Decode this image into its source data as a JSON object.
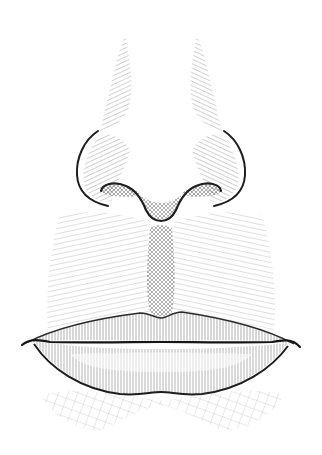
{
  "illustration": {
    "subject": "engraved nose and lips",
    "style": "line engraving / hatching",
    "background": "#ffffff",
    "ink": "#1a1a1a",
    "hatch": "#6e6e6e",
    "hatch_light": "#a8a8a8"
  }
}
